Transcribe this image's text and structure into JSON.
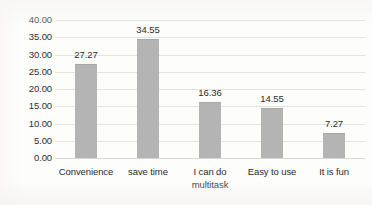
{
  "chart_data": {
    "type": "bar",
    "title": "",
    "subtitle": "",
    "xlabel": "",
    "ylabel": "",
    "categories": [
      "Convenience",
      "save time",
      "I can do\nmultitask",
      "Easy to use",
      "It is fun"
    ],
    "values": [
      27.27,
      34.55,
      16.36,
      14.55,
      7.27
    ],
    "value_labels": [
      "27.27",
      "34.55",
      "16.36",
      "14.55",
      "7.27"
    ],
    "series": [
      {
        "name": "",
        "values": [
          27.27,
          34.55,
          16.36,
          14.55,
          7.27
        ]
      }
    ],
    "ylim": [
      0,
      40
    ],
    "ytick_step": 5,
    "ytick_labels": [
      "0.00",
      "5.00",
      "10.00",
      "15.00",
      "20.00",
      "25.00",
      "30.00",
      "35.00",
      "40.00"
    ],
    "ytick_values": [
      0,
      5,
      10,
      15,
      20,
      25,
      30,
      35,
      40
    ],
    "grid": true,
    "grid_axis": "y",
    "legend": false,
    "legend_position": "none",
    "bar_color": "#b4b4b4",
    "gridline_color": "#e3e3e1",
    "text_color": "#2b2b2b",
    "background_color": "#fdfdfc",
    "data_labels": true,
    "data_label_position": "above"
  }
}
